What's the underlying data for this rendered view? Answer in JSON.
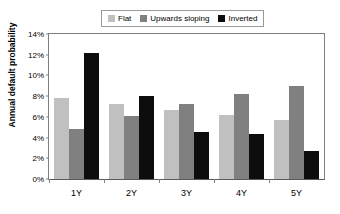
{
  "chart_data": {
    "type": "bar",
    "title": "",
    "xlabel": "",
    "ylabel": "Annual default probability",
    "categories": [
      "1Y",
      "2Y",
      "3Y",
      "4Y",
      "5Y"
    ],
    "ylim": [
      0,
      14
    ],
    "ytick_labels": [
      "14%",
      "12%",
      "10%",
      "8%",
      "6%",
      "4%",
      "2%",
      "0%"
    ],
    "ytick_values": [
      14,
      12,
      10,
      8,
      6,
      4,
      2,
      0
    ],
    "grid": false,
    "legend_position": "top-center",
    "value_suffix": "%",
    "series": [
      {
        "name": "Flat",
        "color": "#c0c0c0",
        "values": [
          7.8,
          7.2,
          6.7,
          6.2,
          5.7
        ]
      },
      {
        "name": "Upwards sloping",
        "color": "#808080",
        "values": [
          4.8,
          6.1,
          7.2,
          8.2,
          9.0
        ]
      },
      {
        "name": "Inverted",
        "color": "#0d0d0d",
        "values": [
          12.2,
          8.0,
          4.5,
          4.3,
          2.7
        ]
      }
    ]
  }
}
